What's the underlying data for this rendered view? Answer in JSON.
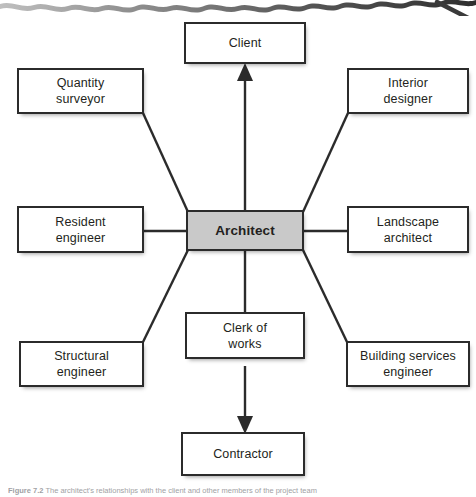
{
  "figure": {
    "type": "hub-and-spoke relationship diagram",
    "center": {
      "id": "architect",
      "label": "Architect",
      "fill_color": "#c9c9c9",
      "text_style": "bold"
    },
    "nodes": [
      {
        "id": "client",
        "label": "Client",
        "position": "top-center"
      },
      {
        "id": "quantity-surveyor",
        "label": "Quantity\nsurveyor",
        "position": "top-left"
      },
      {
        "id": "interior-designer",
        "label": "Interior\ndesigner",
        "position": "top-right"
      },
      {
        "id": "resident-engineer",
        "label": "Resident\nengineer",
        "position": "middle-left"
      },
      {
        "id": "landscape-architect",
        "label": "Landscape\narchitect",
        "position": "middle-right"
      },
      {
        "id": "structural-engineer",
        "label": "Structural\nengineer",
        "position": "bottom-left"
      },
      {
        "id": "building-services-engineer",
        "label": "Building services\nengineer",
        "position": "bottom-right"
      },
      {
        "id": "clerk-of-works",
        "label": "Clerk of\nworks",
        "position": "bottom-center"
      },
      {
        "id": "contractor",
        "label": "Contractor",
        "position": "bottom-center-lower"
      }
    ],
    "connections": [
      {
        "from": "architect",
        "to": "client",
        "arrow": "to",
        "style": "straight-vertical"
      },
      {
        "from": "architect",
        "to": "quantity-surveyor",
        "arrow": "none",
        "style": "diagonal"
      },
      {
        "from": "architect",
        "to": "interior-designer",
        "arrow": "none",
        "style": "diagonal"
      },
      {
        "from": "architect",
        "to": "resident-engineer",
        "arrow": "none",
        "style": "horizontal"
      },
      {
        "from": "architect",
        "to": "landscape-architect",
        "arrow": "none",
        "style": "horizontal"
      },
      {
        "from": "architect",
        "to": "structural-engineer",
        "arrow": "none",
        "style": "diagonal"
      },
      {
        "from": "architect",
        "to": "building-services-engineer",
        "arrow": "none",
        "style": "diagonal"
      },
      {
        "from": "architect",
        "to": "clerk-of-works",
        "arrow": "none",
        "style": "straight-vertical"
      },
      {
        "from": "clerk-of-works",
        "to": "contractor",
        "arrow": "to",
        "style": "straight-vertical"
      }
    ],
    "colors": {
      "box_border": "#2b2b2b",
      "box_fill": "#ffffff",
      "center_fill": "#c9c9c9",
      "line": "#2b2b2b",
      "text": "#231f20",
      "caption_text": "#9fa1a4"
    }
  },
  "caption": {
    "figure_number": "Figure 7.2",
    "text": "The architect's relationships with the client and other members of the project team"
  }
}
